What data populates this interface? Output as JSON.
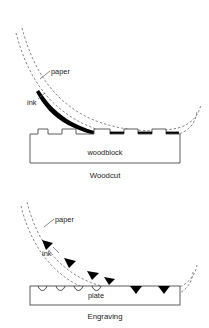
{
  "figure": {
    "background_color": "#ffffff",
    "ink_color": "#000000",
    "paper_line_color": "#6b6b6b",
    "block_line_color": "#4a4a4a"
  },
  "panels": [
    {
      "id": "woodcut",
      "caption": "Woodcut",
      "surface_label": "woodblock",
      "labels": {
        "paper": "paper",
        "ink": "ink"
      },
      "description": "Paper peeling up off a relief woodblock; ink sits on the raised surfaces",
      "surface_type": "relief",
      "relief_teeth": 5,
      "inked_segments": 3
    },
    {
      "id": "engraving",
      "caption": "Engraving",
      "surface_label": "plate",
      "labels": {
        "paper": "paper",
        "ink": "ink"
      },
      "description": "Paper peeling up off an engraved plate; ink sits inside the incised grooves",
      "surface_type": "intaglio",
      "groove_count": 6,
      "inked_grooves": 2,
      "ink_wedges_on_paper": 4
    }
  ]
}
